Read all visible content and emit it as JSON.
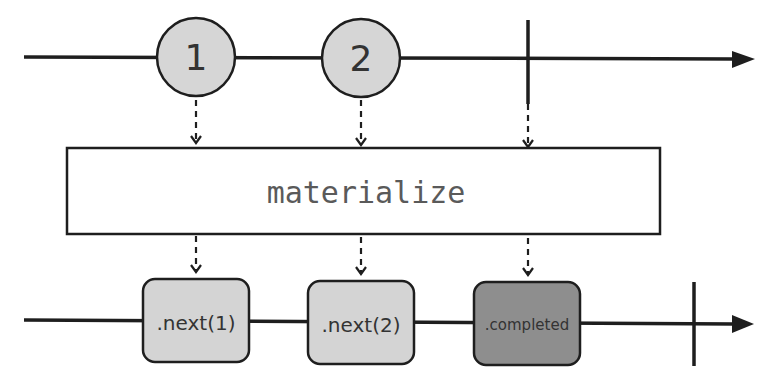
{
  "operator": {
    "name": "materialize"
  },
  "input_stream": {
    "events": [
      {
        "type": "next",
        "label": "1"
      },
      {
        "type": "next",
        "label": "2"
      },
      {
        "type": "completed",
        "label": ""
      }
    ]
  },
  "output_stream": {
    "events": [
      {
        "type": "next",
        "label": ".next(1)"
      },
      {
        "type": "next",
        "label": ".next(2)"
      },
      {
        "type": "next",
        "label": ".completed"
      }
    ],
    "terminates": true
  },
  "colors": {
    "line": "#1e1e1e",
    "marble_fill": "#d6d6d6",
    "next_box_fill": "#d4d4d4",
    "completed_box_fill": "#8e8e8e",
    "operator_text": "#5a5a5a"
  }
}
